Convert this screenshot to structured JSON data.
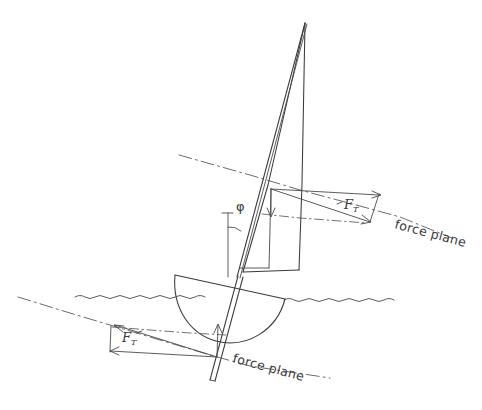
{
  "figure": {
    "background_color": "#ffffff",
    "ink_color": "#3a3a3a",
    "width": 482,
    "height": 410
  },
  "labels": {
    "heel_angle": "φ",
    "sail_force_symbol": "F",
    "sail_force_subscript": "T",
    "keel_force_symbol": "F",
    "keel_force_subscript": "T",
    "force_plane_upper": "force plane",
    "force_plane_lower": "force plane"
  },
  "diagram_data": {
    "type": "diagram",
    "subject": "sailboat heeled showing sail force and keel force acting in parallel force planes",
    "elements": [
      {
        "name": "mast",
        "description": "heeled mast leaning to starboard from hull deck to masthead"
      },
      {
        "name": "sail",
        "description": "tall triangular mainsail between mast and leech"
      },
      {
        "name": "boom",
        "description": "horizontal spar at foot of sail"
      },
      {
        "name": "hull",
        "description": "semicircular hull section heeled, sitting at waterline"
      },
      {
        "name": "keel",
        "description": "narrow keel / centreboard extending below the hull"
      },
      {
        "name": "waterline",
        "description": "wavy free surface line of the water"
      },
      {
        "name": "upper-force-plane",
        "description": "inclined dash-dot line through the sail centre of effort, labelled force plane"
      },
      {
        "name": "lower-force-plane",
        "description": "inclined dash-dot line through the keel centre of lateral resistance, labelled force plane"
      },
      {
        "name": "sail-force-vector",
        "description": "resultant sail force F_T drawn in the upper force plane, pointing down-right"
      },
      {
        "name": "keel-force-vector",
        "description": "resultant keel force F_T drawn in the lower force plane, pointing up-left, equal and opposite to the sail force"
      },
      {
        "name": "heel-angle-mark",
        "description": "angle phi between the vertical reference and the heeled mast"
      }
    ],
    "annotations": [
      {
        "label": "φ",
        "meaning": "heel angle of the boat from vertical"
      },
      {
        "label": "F_T",
        "meaning": "total aerodynamic driving force on the sail"
      },
      {
        "label": "F_T",
        "meaning": "total hydrodynamic reaction force on the keel"
      },
      {
        "label": "force plane",
        "meaning": "plane in which the resultant force acts"
      }
    ]
  }
}
